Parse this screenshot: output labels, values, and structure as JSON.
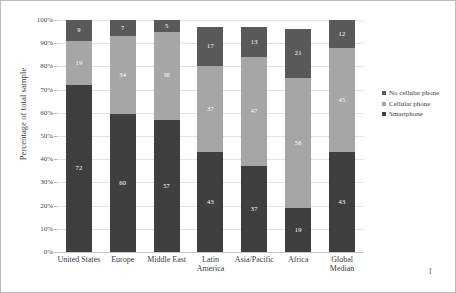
{
  "chart_data": {
    "type": "bar",
    "subtype": "100% stacked column",
    "title": "",
    "xlabel": "",
    "ylabel": "Percentage of total sample",
    "ylim": [
      0,
      100
    ],
    "ytick_labels": [
      "100%",
      "90%",
      "80%",
      "70%",
      "60%",
      "50%",
      "40%",
      "30%",
      "20%",
      "10%",
      "0%"
    ],
    "ytick_values": [
      100,
      90,
      80,
      70,
      60,
      50,
      40,
      30,
      20,
      10,
      0
    ],
    "grid": true,
    "legend_position": "right",
    "categories": [
      "United States",
      "Europe",
      "Middle East",
      "Latin America",
      "Asia/Pacific",
      "Africa",
      "Global Median"
    ],
    "series": [
      {
        "name": "Smartphone",
        "color": "#3f3f3f",
        "values": [
          72,
          60,
          57,
          43,
          37,
          19,
          43
        ]
      },
      {
        "name": "Cellular phone",
        "color": "#a6a6a6",
        "values": [
          19,
          34,
          38,
          37,
          47,
          56,
          45
        ]
      },
      {
        "name": "No cellular phone",
        "color": "#595959",
        "values": [
          9,
          7,
          5,
          17,
          13,
          21,
          12
        ]
      }
    ],
    "stack_order_bottom_to_top": [
      "Smartphone",
      "Cellular phone",
      "No cellular phone"
    ]
  },
  "legend": {
    "items": [
      {
        "label": "No cellular phone",
        "color": "#595959"
      },
      {
        "label": "Cellular phone",
        "color": "#a6a6a6"
      },
      {
        "label": "Smartphone",
        "color": "#3f3f3f"
      }
    ]
  },
  "xlabels": [
    "United States",
    "Europe",
    "Middle East",
    "Latin America",
    "Asia/Pacific",
    "Africa",
    "Global Median"
  ],
  "corner_mark": "I"
}
